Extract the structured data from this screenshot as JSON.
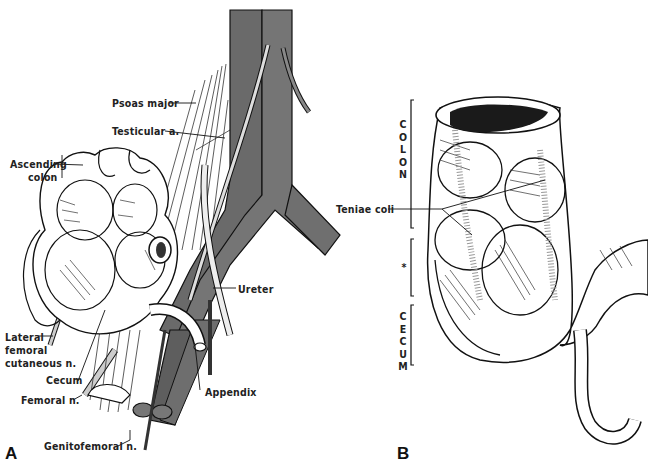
{
  "figure": {
    "panels": [
      {
        "id": "A",
        "letter": "A",
        "labels": {
          "psoas_major": "Psoas major",
          "testicular_a": "Testicular a.",
          "ascending_colon_1": "Ascending",
          "ascending_colon_2": "colon",
          "ureter": "Ureter",
          "lateral_femoral_1": "Lateral",
          "lateral_femoral_2": "femoral",
          "lateral_femoral_3": "cutaneous n.",
          "cecum": "Cecum",
          "femoral_n": "Femoral n.",
          "appendix": "Appendix",
          "genitofemoral_n": "Genitofemoral n."
        }
      },
      {
        "id": "B",
        "letter": "B",
        "labels": {
          "teniae_coli": "Teniae coli",
          "colon_vertical": "C\nO\nL\nO\nN",
          "asterisk": "*",
          "cecum_vertical": "C\nE\nC\nU\nM"
        }
      }
    ],
    "colors": {
      "vessel": "#6e6e6e",
      "vessel_dark": "#555555",
      "ink": "#111111",
      "background": "#ffffff"
    }
  }
}
